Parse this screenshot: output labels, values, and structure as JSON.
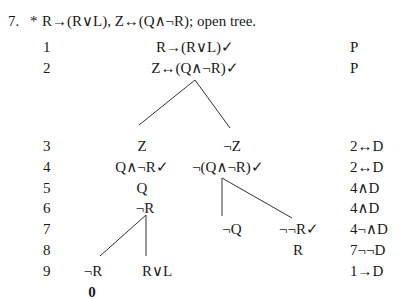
{
  "exercise": {
    "number": "7.",
    "marker": "*",
    "statement": "R→(R∨L), Z↔(Q∧¬R); open tree."
  },
  "rows": [
    {
      "num": "1",
      "just": "P"
    },
    {
      "num": "2",
      "just": "P"
    },
    {
      "num": "3",
      "just": "2↔D"
    },
    {
      "num": "4",
      "just": "2↔D"
    },
    {
      "num": "5",
      "just": "4∧D"
    },
    {
      "num": "6",
      "just": "4∧D"
    },
    {
      "num": "7",
      "just": "4¬∧D"
    },
    {
      "num": "8",
      "just": "7¬¬D"
    },
    {
      "num": "9",
      "just": "1→D"
    }
  ],
  "tree": {
    "trunk": {
      "line1": "R→(R∨L)✓",
      "line2": "Z↔(Q∧¬R)✓"
    },
    "left_branch": {
      "line3": "Z",
      "line4": "Q∧¬R✓",
      "line5": "Q",
      "line6": "¬R",
      "sub_left": {
        "line9": "¬R",
        "close_mark": "0"
      },
      "sub_right": {
        "line9": "R∨L"
      }
    },
    "right_branch": {
      "line3": "¬Z",
      "line4": "¬(Q∧¬R)✓",
      "sub_left": {
        "line7": "¬Q"
      },
      "sub_right": {
        "line7": "¬¬R✓",
        "line8": "R"
      }
    }
  }
}
